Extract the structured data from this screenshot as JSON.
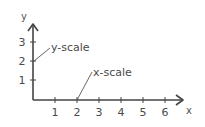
{
  "diagram": {
    "type": "axes-with-annotations",
    "axes": {
      "x_label": "x",
      "y_label": "y",
      "x_ticks": [
        "1",
        "2",
        "3",
        "4",
        "5",
        "6"
      ],
      "y_ticks": [
        "1",
        "2",
        "3"
      ]
    },
    "annotations": [
      {
        "text": "y-scale",
        "points_to": "y=2"
      },
      {
        "text": "x-scale",
        "points_to": "x=2"
      }
    ],
    "colors": {
      "axis": "#444444",
      "text": "#4a4a4a"
    }
  }
}
